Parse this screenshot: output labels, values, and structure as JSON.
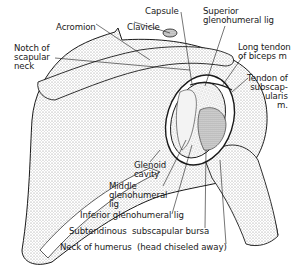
{
  "figure": {
    "colors": {
      "ink": "#1a1a1a",
      "stipple": "#c9c9c9",
      "paper": "#ffffff"
    }
  },
  "labels": {
    "acromion": "Acromion",
    "clavicle": "Clavicle",
    "capsule": "Capsule",
    "superior_gh_lig": "Superior\nglenohumeral lig",
    "notch_scapular_neck": "Notch of\nscapular\nneck",
    "long_tendon_biceps": "Long tendon\nof biceps m",
    "tendon_subscapularis": "Tendon of\nsubscap-\nularis\nm.",
    "glenoid_cavity": "Glenoid\ncavity",
    "middle_gh_lig": "Middle\nglenohumeral\nlig",
    "inferior_gh_lig": "Inferior glenohumeral lig",
    "subtendinous_bursa": "Subtendinous  subscapular bursa",
    "neck_of_humerus": "Neck of humerus  (head chiseled away)"
  }
}
